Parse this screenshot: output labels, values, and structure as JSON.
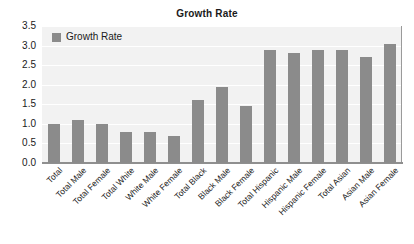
{
  "chart_data": {
    "type": "bar",
    "title": "Growth Rate",
    "xlabel": "",
    "ylabel": "",
    "ylim": [
      0,
      3.5
    ],
    "ytick_step": 0.5,
    "yticks": [
      "3.5",
      "3.0",
      "2.5",
      "2.0",
      "1.5",
      "1.0",
      "0.5",
      "0.0"
    ],
    "grid": true,
    "legend_position": "top-left",
    "legend": [
      "Growth Rate"
    ],
    "series_name": "Growth Rate",
    "bar_color": "#8b8b8b",
    "plot_background": "#f2f2f2",
    "categories": [
      "Total",
      "Total Male",
      "Total Female",
      "Total White",
      "White Male",
      "White Female",
      "Total Black",
      "Black Male",
      "Black Female",
      "Total Hispanic",
      "Hispanic Male",
      "Hispanic Female",
      "Total Asian",
      "Asian Male",
      "Asian Female"
    ],
    "values": [
      1.0,
      1.1,
      1.0,
      0.8,
      0.8,
      0.7,
      1.6,
      1.95,
      1.45,
      2.9,
      2.8,
      2.9,
      2.9,
      2.7,
      3.05
    ]
  },
  "caption": {
    "remnant": ""
  }
}
